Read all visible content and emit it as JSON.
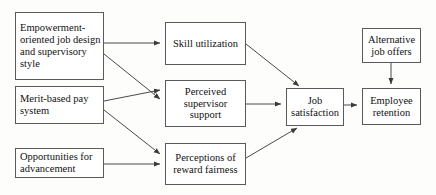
{
  "diagram": {
    "style": {
      "background_color": "#fdfdfb",
      "box_fill_color": "#ffffff",
      "box_border_color": "#5a5a5a",
      "text_color": "#111111",
      "arrow_color": "#444444"
    },
    "nodes": [
      {
        "id": "empowerment",
        "label": "Empowerment-oriented job design and supervisory style",
        "align": "left"
      },
      {
        "id": "merit",
        "label": "Merit-based pay system",
        "align": "left"
      },
      {
        "id": "opportunity",
        "label": "Opportunities for advancement",
        "align": "left"
      },
      {
        "id": "skill",
        "label": "Skill utilization",
        "align": "center"
      },
      {
        "id": "supervisor",
        "label": "Perceived supervisor support",
        "align": "center"
      },
      {
        "id": "fairness",
        "label": "Perceptions of reward fairness",
        "align": "center"
      },
      {
        "id": "satisfaction",
        "label": "Job satisfaction",
        "align": "center"
      },
      {
        "id": "alternative",
        "label": "Alternative job offers",
        "align": "center"
      },
      {
        "id": "retention",
        "label": "Employee retention",
        "align": "center"
      }
    ],
    "edges": [
      {
        "id": "empowerment-to-skill",
        "from": "empowerment",
        "to": "skill",
        "kind": "horizontal"
      },
      {
        "id": "empowerment-to-supervisor",
        "from": "empowerment",
        "to": "supervisor",
        "kind": "diagonal-down"
      },
      {
        "id": "merit-to-supervisor",
        "from": "merit",
        "to": "supervisor",
        "kind": "diagonal-up"
      },
      {
        "id": "merit-to-fairness",
        "from": "merit",
        "to": "fairness",
        "kind": "diagonal-down"
      },
      {
        "id": "opportunity-to-fairness",
        "from": "opportunity",
        "to": "fairness",
        "kind": "horizontal"
      },
      {
        "id": "skill-to-satisfaction",
        "from": "skill",
        "to": "satisfaction",
        "kind": "diagonal-down"
      },
      {
        "id": "supervisor-to-satisfaction",
        "from": "supervisor",
        "to": "satisfaction",
        "kind": "horizontal"
      },
      {
        "id": "fairness-to-satisfaction",
        "from": "fairness",
        "to": "satisfaction",
        "kind": "diagonal-up"
      },
      {
        "id": "satisfaction-to-retention",
        "from": "satisfaction",
        "to": "retention",
        "kind": "horizontal"
      },
      {
        "id": "alternative-to-retention",
        "from": "alternative",
        "to": "retention",
        "kind": "vertical-down"
      }
    ]
  }
}
